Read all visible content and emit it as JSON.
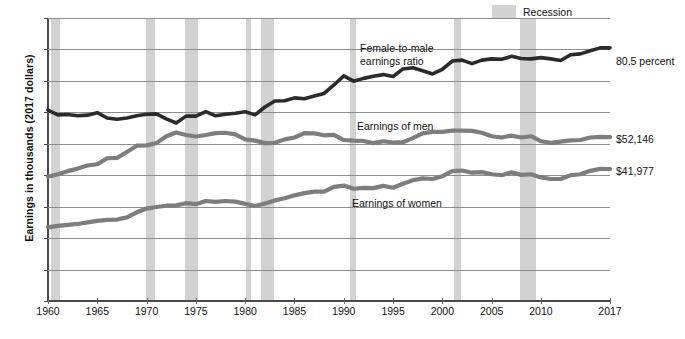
{
  "chart_data": {
    "type": "line",
    "title": "",
    "xlabel": "",
    "ylabel": "Earnings in thousands (2017 dollars)",
    "ylim": [
      0,
      90
    ],
    "xlim": [
      1960,
      2017
    ],
    "grid": true,
    "legend_position": "top-right",
    "y_ticks": [
      "0",
      "10",
      "20",
      "30",
      "40",
      "50",
      "60",
      "70",
      "80",
      "90"
    ],
    "x_ticks": [
      "1960",
      "1965",
      "1970",
      "1975",
      "1980",
      "1985",
      "1990",
      "1995",
      "2000",
      "2005",
      "2010",
      "2017"
    ],
    "x": [
      1960,
      1961,
      1962,
      1963,
      1964,
      1965,
      1966,
      1967,
      1968,
      1969,
      1970,
      1971,
      1972,
      1973,
      1974,
      1975,
      1976,
      1977,
      1978,
      1979,
      1980,
      1981,
      1982,
      1983,
      1984,
      1985,
      1986,
      1987,
      1988,
      1989,
      1990,
      1991,
      1992,
      1993,
      1994,
      1995,
      1996,
      1997,
      1998,
      1999,
      2000,
      2001,
      2002,
      2003,
      2004,
      2005,
      2006,
      2007,
      2008,
      2009,
      2010,
      2011,
      2012,
      2013,
      2014,
      2015,
      2016,
      2017
    ],
    "series": [
      {
        "name": "Female-to-male earnings ratio",
        "units": "percent",
        "color": "#2b2b2b",
        "width": 3.6,
        "values": [
          60.7,
          59.2,
          59.3,
          58.9,
          59.1,
          59.9,
          58.2,
          57.8,
          58.2,
          58.9,
          59.4,
          59.5,
          57.9,
          56.6,
          58.8,
          58.8,
          60.2,
          58.9,
          59.4,
          59.7,
          60.2,
          59.2,
          61.7,
          63.6,
          63.7,
          64.6,
          64.3,
          65.2,
          66.0,
          68.7,
          71.6,
          69.9,
          70.8,
          71.5,
          72.0,
          71.4,
          73.8,
          74.2,
          73.2,
          72.2,
          73.7,
          76.3,
          76.6,
          75.5,
          76.6,
          77.0,
          76.9,
          77.8,
          77.1,
          77.0,
          77.4,
          77.0,
          76.5,
          78.3,
          78.6,
          79.6,
          80.5,
          80.5
        ]
      },
      {
        "name": "Earnings of men",
        "units": "2017 dollars",
        "color": "#7d7d7d",
        "width": 4.2,
        "values": [
          39.5,
          40.3,
          41.3,
          42.1,
          43.1,
          43.5,
          45.4,
          45.5,
          47.4,
          49.4,
          49.5,
          50.2,
          52.4,
          53.6,
          52.8,
          52.3,
          52.8,
          53.4,
          53.5,
          53.0,
          51.4,
          51.0,
          50.2,
          50.3,
          51.4,
          52.0,
          53.4,
          53.3,
          52.7,
          52.8,
          51.2,
          51.0,
          50.9,
          50.2,
          50.8,
          50.4,
          50.5,
          51.8,
          53.3,
          53.8,
          53.8,
          54.2,
          54.2,
          54.1,
          53.5,
          52.4,
          52.0,
          52.6,
          52.0,
          52.4,
          50.8,
          50.3,
          50.7,
          51.1,
          51.2,
          52.0,
          52.2,
          52.146
        ],
        "end_label": "$52,146"
      },
      {
        "name": "Earnings of women",
        "units": "2017 dollars",
        "color": "#7d7d7d",
        "width": 4.2,
        "values": [
          23.4,
          23.9,
          24.2,
          24.5,
          25.0,
          25.5,
          25.8,
          25.9,
          26.6,
          28.2,
          29.4,
          29.9,
          30.3,
          30.4,
          31.1,
          30.8,
          31.8,
          31.5,
          31.8,
          31.6,
          30.9,
          30.2,
          31.0,
          32.0,
          32.7,
          33.6,
          34.3,
          34.8,
          34.8,
          36.3,
          36.7,
          35.7,
          36.0,
          35.9,
          36.6,
          36.0,
          37.3,
          38.4,
          39.0,
          38.8,
          39.7,
          41.3,
          41.5,
          40.8,
          41.0,
          40.3,
          40.0,
          40.9,
          40.1,
          40.3,
          39.3,
          38.8,
          38.8,
          40.0,
          40.3,
          41.4,
          42.0,
          41.977
        ],
        "end_label": "$41,977"
      }
    ],
    "recessions": [
      {
        "start": 1960.3,
        "end": 1961.2
      },
      {
        "start": 1969.9,
        "end": 1970.9
      },
      {
        "start": 1973.9,
        "end": 1975.2
      },
      {
        "start": 1980.1,
        "end": 1980.6
      },
      {
        "start": 1981.6,
        "end": 1982.9
      },
      {
        "start": 1990.6,
        "end": 1991.2
      },
      {
        "start": 2001.2,
        "end": 2001.9
      },
      {
        "start": 2007.9,
        "end": 2009.5
      }
    ],
    "annotations": [
      {
        "name": "ratio-label",
        "line1": "Female-to-male",
        "line2": "earnings ratio"
      },
      {
        "name": "men-label",
        "line1": "Earnings of men",
        "line2": ""
      },
      {
        "name": "women-label",
        "line1": "Earnings of women",
        "line2": ""
      }
    ],
    "end_labels": {
      "ratio": "80.5 percent",
      "men": "$52,146",
      "women": "$41,977"
    },
    "legend": [
      {
        "label": "Recession",
        "color": "#d2d2d2"
      }
    ]
  }
}
